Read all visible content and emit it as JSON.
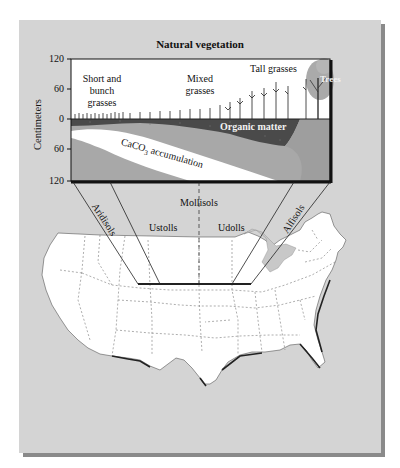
{
  "title": "Natural vegetation",
  "y_axis": {
    "label": "Centimeters",
    "ticks_above": [
      "120",
      "60",
      "0"
    ],
    "ticks_below": [
      "60",
      "120"
    ]
  },
  "vegetation": {
    "short": [
      "Short and",
      "bunch",
      "grasses"
    ],
    "mixed": [
      "Mixed",
      "grasses"
    ],
    "tall": "Tall grasses",
    "trees": "Trees"
  },
  "soil_layers": {
    "organic": "Organic matter",
    "caco3_prefix": "CaCO",
    "caco3_sub": "3",
    "caco3_suffix": " accumulation"
  },
  "soil_orders": {
    "aridisols": "Aridisols",
    "mollisols": "Mollisols",
    "ustolls": "Ustolls",
    "udolls": "Udolls",
    "alfisols": "Alfisols"
  },
  "colors": {
    "panel": "#d4d4d4",
    "panel_shadow": "#8a8a8a",
    "sky": "#ffffff",
    "organic": "#555555",
    "subsoil": "#a8a8a8",
    "caco3": "#ffffff",
    "map_land": "#ffffff",
    "lakes": "#c8c8c8"
  }
}
